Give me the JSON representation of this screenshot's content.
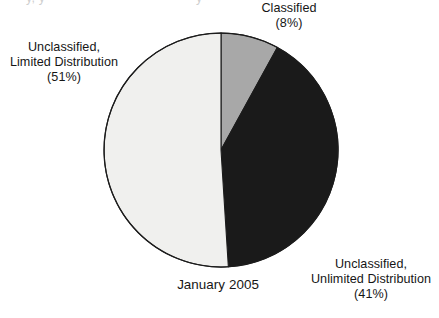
{
  "figure": {
    "clipped_header_fragments": [
      "y, y",
      "y"
    ],
    "period_label": "January 2005"
  },
  "labels": {
    "classified": "Classified\n(8%)",
    "limited": "Unclassified,\nLimited Distribution\n(51%)",
    "unlimited": "Unclassified,\nUnlimited Distribution\n(41%)"
  },
  "colors": {
    "classified": "#a8a8a8",
    "unlimited": "#1a1a1a",
    "limited": "#f0f0ee",
    "outline": "#1c1c1c",
    "background": "#ffffff"
  },
  "geometry": {
    "center_x": 221,
    "center_y": 150,
    "radius": 117,
    "start_angle_deg": 0,
    "direction": "clockwise"
  },
  "chart_data": {
    "type": "pie",
    "title": "",
    "subtitle": "",
    "xlabel": "",
    "ylabel": "",
    "annotations": [
      "January 2005"
    ],
    "legend_position": "none",
    "grid": false,
    "value_unit": "percent",
    "total": 100,
    "categories": [
      "Classified",
      "Unclassified, Unlimited Distribution",
      "Unclassified, Limited Distribution"
    ],
    "values": [
      8,
      41,
      51
    ],
    "slices": [
      {
        "label": "Classified",
        "value": 8,
        "display": "(8%)",
        "color": "#a8a8a8",
        "start_angle_deg": 0.0,
        "end_angle_deg": 28.8,
        "label_position": "top-right"
      },
      {
        "label": "Unclassified, Unlimited Distribution",
        "value": 41,
        "display": "(41%)",
        "color": "#1a1a1a",
        "start_angle_deg": 28.8,
        "end_angle_deg": 176.4,
        "label_position": "bottom-right"
      },
      {
        "label": "Unclassified, Limited Distribution",
        "value": 51,
        "display": "(51%)",
        "color": "#f0f0ee",
        "start_angle_deg": 176.4,
        "end_angle_deg": 360.0,
        "label_position": "left"
      }
    ]
  }
}
